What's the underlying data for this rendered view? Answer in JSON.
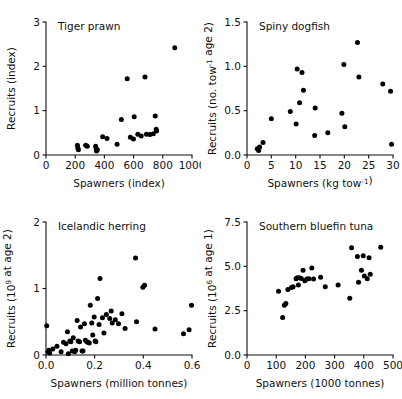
{
  "figure": {
    "background": "#ffffff",
    "point_color": "#000000",
    "axis_color": "#111111",
    "panel_count": 4
  },
  "chart_data": [
    {
      "type": "scatter",
      "title": "Tiger prawn",
      "xlabel": "Spawners (index)",
      "ylabel": "Recruits (index)",
      "ylabel_parts": [
        {
          "text": "Recruits (index)",
          "sup": ""
        }
      ],
      "xlim": [
        0,
        1000
      ],
      "ylim": [
        0,
        3
      ],
      "xticks": [
        0,
        200,
        400,
        600,
        800,
        1000
      ],
      "xticklabels": [
        "0",
        "200",
        "400",
        "600",
        "800",
        "1000"
      ],
      "yticks": [
        0,
        1,
        2,
        3
      ],
      "yticklabels": [
        "0",
        "1",
        "2",
        "3"
      ],
      "grid": false,
      "legend": "none",
      "points": [
        [
          215,
          0.22
        ],
        [
          218,
          0.16
        ],
        [
          222,
          0.12
        ],
        [
          272,
          0.22
        ],
        [
          283,
          0.2
        ],
        [
          340,
          0.2
        ],
        [
          344,
          0.14
        ],
        [
          346,
          0.09
        ],
        [
          352,
          0.12
        ],
        [
          388,
          0.41
        ],
        [
          418,
          0.37
        ],
        [
          487,
          0.24
        ],
        [
          516,
          0.8
        ],
        [
          556,
          1.72
        ],
        [
          578,
          0.4
        ],
        [
          599,
          0.36
        ],
        [
          604,
          0.86
        ],
        [
          629,
          0.47
        ],
        [
          652,
          0.43
        ],
        [
          678,
          1.76
        ],
        [
          688,
          0.47
        ],
        [
          712,
          0.46
        ],
        [
          735,
          0.48
        ],
        [
          748,
          0.88
        ],
        [
          755,
          0.58
        ],
        [
          757,
          0.54
        ],
        [
          882,
          2.42
        ]
      ]
    },
    {
      "type": "scatter",
      "title": "Spiny dogfish",
      "xlabel": "Spawners (kg tow−1)",
      "xlabel_parts": [
        {
          "text": "Spawners (kg tow",
          "sup": "-1"
        },
        {
          "text": ")",
          "sup": ""
        }
      ],
      "ylabel": "Recruits (no. tow−1 age 2)",
      "ylabel_parts": [
        {
          "text": "Recruits (no. tow",
          "sup": "-1"
        },
        {
          "text": " age 2)",
          "sup": ""
        }
      ],
      "xlim": [
        0,
        30
      ],
      "ylim": [
        0,
        1.5
      ],
      "xticks": [
        0,
        5,
        10,
        15,
        20,
        25,
        30
      ],
      "xticklabels": [
        "0",
        "5",
        "10",
        "15",
        "20",
        "25",
        "30"
      ],
      "yticks": [
        0,
        0.5,
        1.0,
        1.5
      ],
      "yticklabels": [
        "0.0",
        "0.5",
        "1.0",
        "1.5"
      ],
      "grid": false,
      "legend": "none",
      "points": [
        [
          2.1,
          0.07
        ],
        [
          2.4,
          0.05
        ],
        [
          2.6,
          0.09
        ],
        [
          3.3,
          0.14
        ],
        [
          5.0,
          0.41
        ],
        [
          8.9,
          0.49
        ],
        [
          10.1,
          0.35
        ],
        [
          10.3,
          0.97
        ],
        [
          10.8,
          0.59
        ],
        [
          11.3,
          0.93
        ],
        [
          11.6,
          0.73
        ],
        [
          13.9,
          0.22
        ],
        [
          14.0,
          0.53
        ],
        [
          16.6,
          0.25
        ],
        [
          19.5,
          0.47
        ],
        [
          19.9,
          1.02
        ],
        [
          20.1,
          0.32
        ],
        [
          22.7,
          1.27
        ],
        [
          23.0,
          0.88
        ],
        [
          27.9,
          0.8
        ],
        [
          29.5,
          0.72
        ],
        [
          29.7,
          0.12
        ]
      ]
    },
    {
      "type": "scatter",
      "title": "Icelandic herring",
      "xlabel": "Spawners (million tonnes)",
      "ylabel": "Recruits (109 at age 2)",
      "ylabel_parts": [
        {
          "text": "Recruits (10",
          "sup": "9"
        },
        {
          "text": " at age 2)",
          "sup": ""
        }
      ],
      "xlim": [
        0,
        0.6
      ],
      "ylim": [
        0,
        2
      ],
      "xticks": [
        0,
        0.2,
        0.4,
        0.6
      ],
      "xticklabels": [
        "0.0",
        "0.2",
        "0.4",
        "0.6"
      ],
      "yticks": [
        0,
        1,
        2
      ],
      "yticklabels": [
        "0",
        "1",
        "2"
      ],
      "grid": false,
      "legend": "none",
      "points": [
        [
          0.003,
          0.44
        ],
        [
          0.008,
          0.05
        ],
        [
          0.012,
          0.07
        ],
        [
          0.015,
          0.03
        ],
        [
          0.028,
          0.09
        ],
        [
          0.045,
          0.13
        ],
        [
          0.062,
          0.05
        ],
        [
          0.072,
          0.19
        ],
        [
          0.082,
          0.17
        ],
        [
          0.088,
          0.35
        ],
        [
          0.092,
          0.02
        ],
        [
          0.098,
          0.21
        ],
        [
          0.102,
          0.2
        ],
        [
          0.108,
          0.06
        ],
        [
          0.112,
          0.26
        ],
        [
          0.118,
          0.05
        ],
        [
          0.122,
          0.07
        ],
        [
          0.128,
          0.52
        ],
        [
          0.132,
          0.21
        ],
        [
          0.138,
          0.2
        ],
        [
          0.142,
          0.42
        ],
        [
          0.148,
          0.06
        ],
        [
          0.152,
          0.06
        ],
        [
          0.158,
          0.47
        ],
        [
          0.162,
          0.22
        ],
        [
          0.168,
          0.2
        ],
        [
          0.172,
          0.19
        ],
        [
          0.178,
          0.18
        ],
        [
          0.182,
          0.75
        ],
        [
          0.188,
          0.48
        ],
        [
          0.192,
          0.3
        ],
        [
          0.198,
          0.57
        ],
        [
          0.202,
          0.21
        ],
        [
          0.205,
          0.2
        ],
        [
          0.212,
          0.85
        ],
        [
          0.218,
          0.46
        ],
        [
          0.222,
          1.15
        ],
        [
          0.232,
          0.56
        ],
        [
          0.238,
          0.33
        ],
        [
          0.248,
          0.61
        ],
        [
          0.262,
          0.55
        ],
        [
          0.268,
          0.66
        ],
        [
          0.272,
          0.48
        ],
        [
          0.285,
          0.53
        ],
        [
          0.298,
          0.47
        ],
        [
          0.312,
          0.62
        ],
        [
          0.325,
          0.4
        ],
        [
          0.368,
          1.46
        ],
        [
          0.372,
          0.5
        ],
        [
          0.398,
          1.02
        ],
        [
          0.405,
          1.05
        ],
        [
          0.448,
          0.39
        ],
        [
          0.565,
          0.32
        ],
        [
          0.588,
          0.38
        ],
        [
          0.598,
          0.75
        ]
      ]
    },
    {
      "type": "scatter",
      "title": "Southern bluefin tuna",
      "xlabel": "Spawners (1000 tonnes)",
      "ylabel": "Recruits (106 at age 1)",
      "ylabel_parts": [
        {
          "text": "Recruits (10",
          "sup": "6"
        },
        {
          "text": " at age 1)",
          "sup": ""
        }
      ],
      "xlim": [
        0,
        500
      ],
      "ylim": [
        0,
        7.5
      ],
      "xticks": [
        0,
        100,
        200,
        300,
        400,
        500
      ],
      "xticklabels": [
        "0",
        "100",
        "200",
        "300",
        "400",
        "500"
      ],
      "yticks": [
        0,
        2.5,
        5.0,
        7.5
      ],
      "yticklabels": [
        "0.0",
        "2.5",
        "5.0",
        "7.5"
      ],
      "grid": false,
      "legend": "none",
      "points": [
        [
          108,
          3.6
        ],
        [
          122,
          2.12
        ],
        [
          128,
          2.8
        ],
        [
          133,
          2.9
        ],
        [
          140,
          3.7
        ],
        [
          152,
          3.8
        ],
        [
          158,
          3.85
        ],
        [
          168,
          4.3
        ],
        [
          172,
          4.35
        ],
        [
          176,
          3.95
        ],
        [
          180,
          4.35
        ],
        [
          186,
          4.32
        ],
        [
          192,
          4.78
        ],
        [
          198,
          4.18
        ],
        [
          205,
          4.28
        ],
        [
          212,
          4.3
        ],
        [
          222,
          4.9
        ],
        [
          228,
          4.28
        ],
        [
          252,
          4.38
        ],
        [
          268,
          3.85
        ],
        [
          312,
          3.95
        ],
        [
          352,
          3.2
        ],
        [
          358,
          6.05
        ],
        [
          378,
          5.55
        ],
        [
          382,
          4.1
        ],
        [
          392,
          4.78
        ],
        [
          398,
          5.6
        ],
        [
          402,
          4.45
        ],
        [
          412,
          4.3
        ],
        [
          418,
          5.48
        ],
        [
          422,
          4.55
        ],
        [
          458,
          6.08
        ]
      ]
    }
  ]
}
